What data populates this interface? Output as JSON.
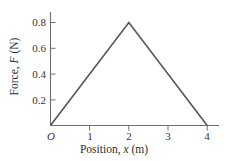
{
  "chart_data": {
    "type": "line",
    "title": "",
    "subtitle": "",
    "xlabel_parts": {
      "prefix": "Position, ",
      "variable": "x",
      "suffix": " (m)"
    },
    "ylabel_parts": {
      "prefix": "Force, ",
      "variable": "F",
      "suffix": " (N)"
    },
    "xlabel": "Position, x (m)",
    "ylabel": "Force, F (N)",
    "x": [
      0,
      2,
      4
    ],
    "values": [
      0,
      0.8,
      0
    ],
    "series": [
      {
        "name": "Force vs Position",
        "x": [
          0,
          2,
          4
        ],
        "values": [
          0,
          0.8,
          0
        ],
        "color": "#555555"
      }
    ],
    "xlim": [
      0,
      4.25
    ],
    "ylim": [
      0,
      0.9
    ],
    "xticks": [
      0,
      1,
      2,
      3,
      4
    ],
    "xticklabels": [
      "O",
      "1",
      "2",
      "3",
      "4"
    ],
    "yticks": [
      0.2,
      0.4,
      0.6,
      0.8
    ],
    "yticklabels": [
      "0.2",
      "0.4",
      "0.6",
      "0.8"
    ],
    "grid": false,
    "legend": false,
    "legend_position": "none",
    "annotations": [],
    "axis_color": "#6e6e6e",
    "background_color": "#ffffff"
  },
  "ticks": {
    "y": [
      {
        "label": "0.8"
      },
      {
        "label": "0.6"
      },
      {
        "label": "0.4"
      },
      {
        "label": "0.2"
      }
    ],
    "x": [
      {
        "label": "O"
      },
      {
        "label": "1"
      },
      {
        "label": "2"
      },
      {
        "label": "3"
      },
      {
        "label": "4"
      }
    ]
  }
}
